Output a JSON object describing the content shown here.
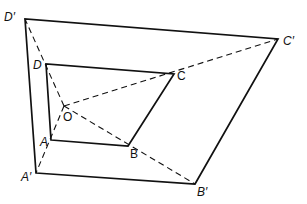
{
  "diagram": {
    "type": "geometry-enlargement",
    "center": {
      "name": "O",
      "label": "O",
      "x": 64,
      "y": 106,
      "label_x": 63,
      "label_y": 121
    },
    "inner_shape": {
      "name": "ABCD",
      "vertices": [
        {
          "name": "A",
          "label": "A",
          "x": 51,
          "y": 140,
          "label_x": 40,
          "label_y": 146
        },
        {
          "name": "B",
          "label": "B",
          "x": 128,
          "y": 146,
          "label_x": 130,
          "label_y": 158
        },
        {
          "name": "C",
          "label": "C",
          "x": 174,
          "y": 74,
          "label_x": 177,
          "label_y": 80
        },
        {
          "name": "D",
          "label": "D",
          "x": 46,
          "y": 64,
          "label_x": 33,
          "label_y": 69
        }
      ]
    },
    "outer_shape": {
      "name": "A'B'C'D'",
      "vertices": [
        {
          "name": "A'",
          "label": "A′",
          "x": 36,
          "y": 173,
          "label_x": 21,
          "label_y": 181
        },
        {
          "name": "B'",
          "label": "B′",
          "x": 195,
          "y": 184,
          "label_x": 197,
          "label_y": 196
        },
        {
          "name": "C'",
          "label": "C′",
          "x": 278,
          "y": 39,
          "label_x": 283,
          "label_y": 45
        },
        {
          "name": "D'",
          "label": "D′",
          "x": 25,
          "y": 19,
          "label_x": 4,
          "label_y": 21
        }
      ]
    },
    "rays": [
      {
        "from": "O",
        "to": "A'"
      },
      {
        "from": "O",
        "to": "B'"
      },
      {
        "from": "O",
        "to": "C'"
      },
      {
        "from": "O",
        "to": "D'"
      }
    ],
    "colors": {
      "stroke": "#111111",
      "background": "#ffffff"
    }
  }
}
